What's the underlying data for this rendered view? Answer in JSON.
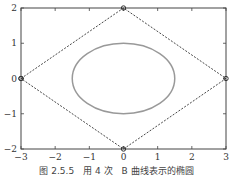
{
  "chart_data": {
    "type": "line",
    "title": "",
    "xlabel": "",
    "ylabel": "",
    "xlim": [
      -3,
      3
    ],
    "ylim": [
      -2,
      2
    ],
    "x_ticks": [
      -3,
      -2,
      -1,
      0,
      1,
      2,
      3
    ],
    "y_ticks": [
      -2,
      -1,
      0,
      1,
      2
    ],
    "x_tick_labels": [
      "−3",
      "−2",
      "−1",
      "0",
      "1",
      "2",
      "3"
    ],
    "y_tick_labels": [
      "−2",
      "−1",
      "0",
      "1",
      "2"
    ],
    "grid": false,
    "series": [
      {
        "name": "control polygon",
        "style": "dashed",
        "markers": "circle",
        "color": "#333333",
        "x": [
          -3,
          0,
          3,
          0,
          -3
        ],
        "y": [
          0,
          2,
          0,
          -2,
          0
        ]
      },
      {
        "name": "ellipse (B-spline curve)",
        "style": "solid",
        "color": "#999999",
        "center": [
          0,
          0
        ],
        "rx": 1.5,
        "ry": 1
      }
    ]
  },
  "caption": "图 2.5.5　用 4 次　B 曲线表示的椭圆"
}
